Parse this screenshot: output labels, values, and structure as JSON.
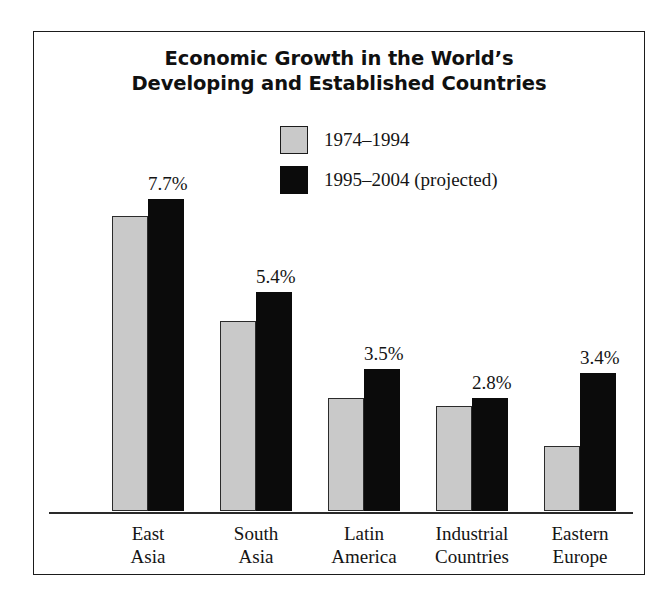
{
  "figure": {
    "title_lines": [
      "Economic Growth in the World’s",
      "Developing and Established Countries"
    ],
    "frame": true
  },
  "legend": {
    "position": "top-center",
    "items": [
      {
        "label": "1974–1994",
        "swatch": "gray",
        "color": "#c9c9c9"
      },
      {
        "label": "1995–2004 (projected)",
        "swatch": "black",
        "color": "#0b0b0b"
      }
    ]
  },
  "chart_data": {
    "type": "bar",
    "title": "Economic Growth in the World’s Developing and Established Countries",
    "xlabel": "",
    "ylabel": "",
    "ylim": [
      0,
      8.4
    ],
    "grid": false,
    "legend_position": "top-center",
    "categories": [
      "East Asia",
      "South Asia",
      "Latin America",
      "Industrial Countries",
      "Eastern Europe"
    ],
    "category_lines": [
      [
        "East",
        "Asia"
      ],
      [
        "South",
        "Asia"
      ],
      [
        "Latin",
        "America"
      ],
      [
        "Industrial",
        "Countries"
      ],
      [
        "Eastern",
        "Europe"
      ]
    ],
    "series": [
      {
        "name": "1974–1994",
        "color": "#c9c9c9",
        "values": [
          7.3,
          4.7,
          2.8,
          2.6,
          1.6
        ],
        "labels": [
          "",
          "",
          "",
          "",
          ""
        ]
      },
      {
        "name": "1995–2004 (projected)",
        "color": "#0b0b0b",
        "values": [
          7.7,
          5.4,
          3.5,
          2.8,
          3.4
        ],
        "labels": [
          "7.7%",
          "5.4%",
          "3.5%",
          "2.8%",
          "3.4%"
        ]
      }
    ],
    "value_labels": [
      "7.7%",
      "5.4%",
      "3.5%",
      "2.8%",
      "3.4%"
    ]
  }
}
